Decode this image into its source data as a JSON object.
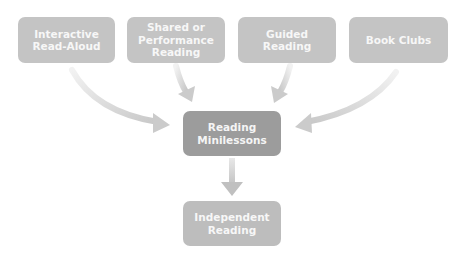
{
  "diagram": {
    "type": "flow",
    "colors": {
      "top_box": "#c4c4c4",
      "center_box": "#9c9c9c",
      "bottom_box": "#bdbdbd",
      "arrow": "#cfcfcf",
      "text": "#f7f7f7"
    },
    "top_boxes": [
      {
        "id": "interactive-read-aloud",
        "lines": [
          "Interactive",
          "Read-Aloud"
        ]
      },
      {
        "id": "shared-performance-reading",
        "lines": [
          "Shared or",
          "Performance",
          "Reading"
        ]
      },
      {
        "id": "guided-reading",
        "lines": [
          "Guided Reading"
        ]
      },
      {
        "id": "book-clubs",
        "lines": [
          "Book Clubs"
        ]
      }
    ],
    "center_box": {
      "id": "reading-minilessons",
      "lines": [
        "Reading",
        "Minilessons"
      ]
    },
    "bottom_box": {
      "id": "independent-reading",
      "lines": [
        "Independent",
        "Reading"
      ]
    },
    "edges": [
      {
        "from": "interactive-read-aloud",
        "to": "reading-minilessons"
      },
      {
        "from": "shared-performance-reading",
        "to": "reading-minilessons"
      },
      {
        "from": "guided-reading",
        "to": "reading-minilessons"
      },
      {
        "from": "book-clubs",
        "to": "reading-minilessons"
      },
      {
        "from": "reading-minilessons",
        "to": "independent-reading"
      }
    ]
  }
}
